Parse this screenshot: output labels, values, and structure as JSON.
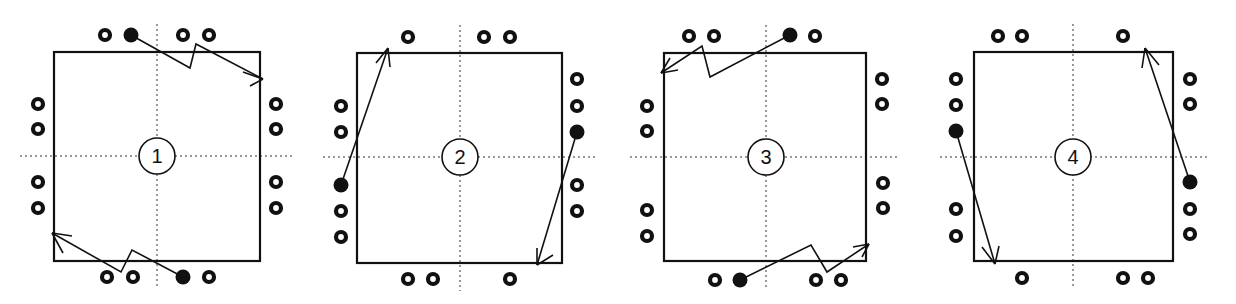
{
  "figure": {
    "colors": {
      "ink": "#111111",
      "background": "#ffffff"
    },
    "panels": [
      {
        "label": "1",
        "square": [
          54,
          52,
          260,
          261
        ],
        "center": [
          157,
          156
        ],
        "hollow": [
          [
            105,
            35
          ],
          [
            183,
            35
          ],
          [
            209,
            35
          ],
          [
            38,
            104
          ],
          [
            38,
            129
          ],
          [
            38,
            182
          ],
          [
            38,
            208
          ],
          [
            276,
            104
          ],
          [
            276,
            129
          ],
          [
            276,
            182
          ],
          [
            276,
            208
          ],
          [
            107,
            277
          ],
          [
            133,
            277
          ],
          [
            209,
            277
          ]
        ],
        "filled": [
          [
            131,
            35
          ],
          [
            183,
            277
          ]
        ],
        "paths": [
          {
            "points": [
              [
                131,
                35
              ],
              [
                190,
                68
              ],
              [
                196,
                44
              ],
              [
                263,
                79
              ]
            ],
            "head": [
              [
                243,
                72
              ],
              [
                250,
                86
              ]
            ]
          },
          {
            "points": [
              [
                183,
                277
              ],
              [
                132,
                250
              ],
              [
                121,
                272
              ],
              [
                52,
                233
              ]
            ],
            "head": [
              [
                72,
                236
              ],
              [
                63,
                253
              ]
            ]
          }
        ]
      },
      {
        "label": "2",
        "square": [
          357,
          53,
          562,
          263
        ],
        "center": [
          460,
          157
        ],
        "hollow": [
          [
            408,
            37
          ],
          [
            484,
            37
          ],
          [
            510,
            37
          ],
          [
            341,
            106
          ],
          [
            341,
            132
          ],
          [
            341,
            211
          ],
          [
            341,
            237
          ],
          [
            577,
            79
          ],
          [
            577,
            106
          ],
          [
            577,
            185
          ],
          [
            577,
            211
          ],
          [
            408,
            279
          ],
          [
            433,
            279
          ],
          [
            510,
            279
          ]
        ],
        "filled": [
          [
            341,
            185
          ],
          [
            577,
            132
          ]
        ],
        "paths": [
          {
            "points": [
              [
                341,
                185
              ],
              [
                388,
                48
              ]
            ],
            "head": [
              [
                376,
                63
              ],
              [
                390,
                67
              ]
            ]
          },
          {
            "points": [
              [
                577,
                132
              ],
              [
                537,
                265
              ]
            ],
            "head": [
              [
                537,
                248
              ],
              [
                553,
                255
              ]
            ]
          }
        ]
      },
      {
        "label": "3",
        "square": [
          664,
          53,
          866,
          261
        ],
        "center": [
          766,
          157
        ],
        "hollow": [
          [
            689,
            36
          ],
          [
            714,
            36
          ],
          [
            815,
            36
          ],
          [
            647,
            106
          ],
          [
            647,
            131
          ],
          [
            647,
            210
          ],
          [
            647,
            236
          ],
          [
            882,
            79
          ],
          [
            882,
            104
          ],
          [
            883,
            183
          ],
          [
            883,
            208
          ],
          [
            715,
            280
          ],
          [
            816,
            280
          ],
          [
            841,
            280
          ]
        ],
        "filled": [
          [
            790,
            35
          ],
          [
            740,
            280
          ]
        ],
        "paths": [
          {
            "points": [
              [
                790,
                35
              ],
              [
                710,
                77
              ],
              [
                702,
                46
              ],
              [
                661,
                73
              ]
            ],
            "head": [
              [
                670,
                58
              ],
              [
                678,
                70
              ]
            ]
          },
          {
            "points": [
              [
                740,
                280
              ],
              [
                811,
                245
              ],
              [
                827,
                272
              ],
              [
                869,
                244
              ]
            ],
            "head": [
              [
                853,
                247
              ],
              [
                862,
                257
              ]
            ]
          }
        ]
      },
      {
        "label": "4",
        "square": [
          974,
          52,
          1173,
          261
        ],
        "center": [
          1073,
          157
        ],
        "hollow": [
          [
            998,
            36
          ],
          [
            1022,
            36
          ],
          [
            1123,
            36
          ],
          [
            956,
            79
          ],
          [
            956,
            105
          ],
          [
            956,
            209
          ],
          [
            956,
            236
          ],
          [
            1190,
            79
          ],
          [
            1190,
            104
          ],
          [
            1190,
            209
          ],
          [
            1190,
            234
          ],
          [
            1022,
            278
          ],
          [
            1123,
            278
          ],
          [
            1148,
            278
          ]
        ],
        "filled": [
          [
            956,
            131
          ],
          [
            1190,
            182
          ]
        ],
        "paths": [
          {
            "points": [
              [
                956,
                131
              ],
              [
                995,
                264
              ]
            ],
            "head": [
              [
                982,
                247
              ],
              [
                999,
                246
              ]
            ]
          },
          {
            "points": [
              [
                1190,
                182
              ],
              [
                1145,
                48
              ]
            ],
            "head": [
              [
                1142,
                68
              ],
              [
                1159,
                65
              ]
            ]
          }
        ]
      }
    ]
  }
}
